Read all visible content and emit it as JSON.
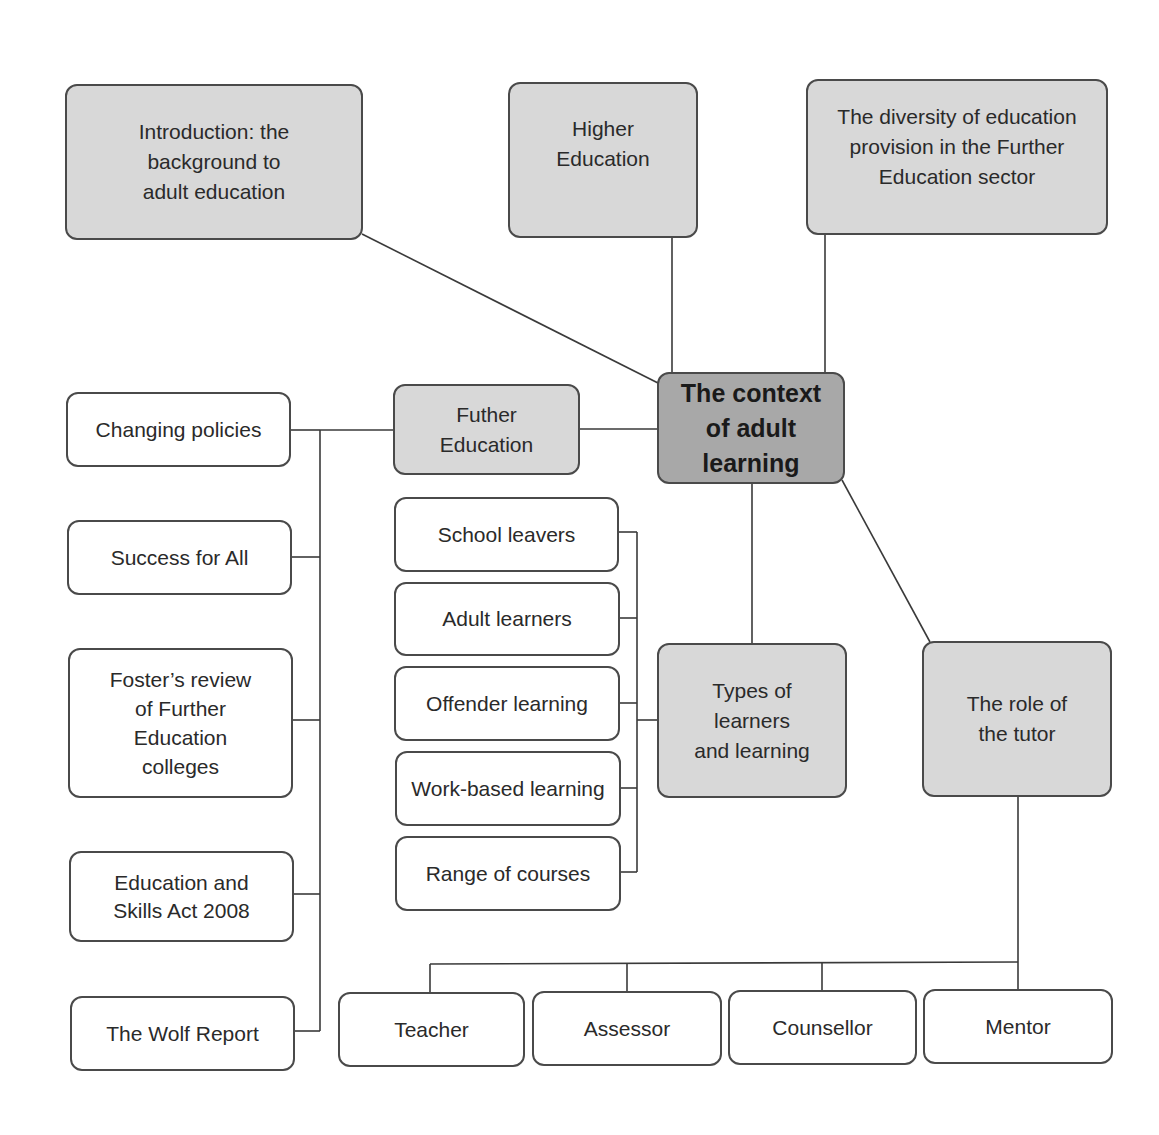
{
  "diagram": {
    "center": "The context\nof adult\nlearning",
    "topics": {
      "introduction": "Introduction: the\nbackground to\nadult education",
      "higher_education": "Higher\nEducation",
      "diversity": "The diversity of education\nprovision in the Further\nEducation sector",
      "further_education": "Futher\nEducation",
      "types_of_learners": "Types of\nlearners\nand learning",
      "role_of_tutor": "The role of\nthe tutor"
    },
    "further_education_children": [
      "Changing policies",
      "Success for All",
      "Foster’s review\nof Further\nEducation\ncolleges",
      "Education and\nSkills Act 2008",
      "The Wolf Report"
    ],
    "learner_types": [
      "School leavers",
      "Adult learners",
      "Offender learning",
      "Work-based learning",
      "Range of courses"
    ],
    "tutor_roles": [
      "Teacher",
      "Assessor",
      "Counsellor",
      "Mentor"
    ]
  }
}
